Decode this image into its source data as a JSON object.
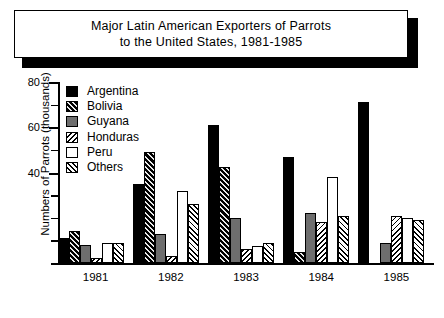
{
  "title": {
    "line1": "Major Latin American Exporters of Parrots",
    "line2": "to the United States, 1981-1985"
  },
  "chart_data": {
    "type": "bar",
    "title": "Major Latin American Exporters of Parrots to the United States, 1981-1985",
    "xlabel": "",
    "ylabel": "Numbers of Parrots (thousands)",
    "ylim": [
      0,
      80
    ],
    "ytick_labels": [
      "80",
      "60",
      "40"
    ],
    "ytick_values": [
      80,
      60,
      40
    ],
    "minor_tick_step": 10,
    "grid": false,
    "legend_position": "upper-left-inside",
    "categories": [
      "1981",
      "1982",
      "1983",
      "1984",
      "1985"
    ],
    "series": [
      {
        "name": "Argentina",
        "color": "#000000",
        "pattern": "solid-black",
        "values": [
          11,
          35,
          61,
          47,
          71
        ]
      },
      {
        "name": "Bolivia",
        "color": "#2b2b2b",
        "pattern": "dense-hatch-dark",
        "values": [
          14,
          49,
          42.5,
          5,
          0
        ]
      },
      {
        "name": "Guyana",
        "color": "#6e6e6e",
        "pattern": "solid-gray",
        "values": [
          8,
          13,
          20,
          22,
          9
        ]
      },
      {
        "name": "Honduras",
        "color": "#ffffff",
        "pattern": "diagonal-hatch-light",
        "values": [
          2,
          3,
          6,
          18,
          21
        ]
      },
      {
        "name": "Peru",
        "color": "#ffffff",
        "pattern": "white-outline",
        "values": [
          9,
          32,
          7.5,
          38,
          20
        ]
      },
      {
        "name": "Others",
        "color": "#ffffff",
        "pattern": "back-hatch-white",
        "values": [
          9,
          26,
          9,
          21,
          19
        ]
      }
    ]
  }
}
